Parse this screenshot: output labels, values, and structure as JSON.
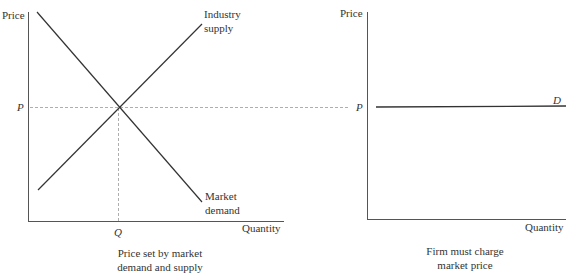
{
  "left_panel": {
    "y_axis_label": "Price",
    "x_axis_label": "Quantity",
    "price_marker": "P",
    "quantity_marker": "Q",
    "supply_label_line1": "Industry",
    "supply_label_line2": "supply",
    "demand_label_line1": "Market",
    "demand_label_line2": "demand",
    "caption_line1": "Price set by market",
    "caption_line2": "demand and supply"
  },
  "right_panel": {
    "y_axis_label": "Price",
    "x_axis_label": "Quantity",
    "price_marker": "P",
    "demand_label": "D",
    "caption_line1": "Firm must charge",
    "caption_line2": "market price"
  },
  "colors": {
    "line": "#333333",
    "dashed": "#999999"
  }
}
